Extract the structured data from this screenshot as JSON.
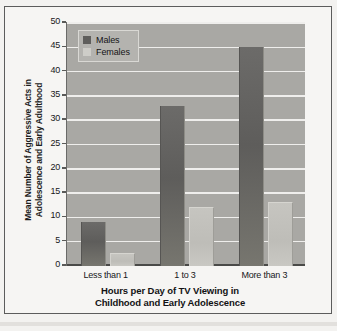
{
  "chart_data": {
    "type": "bar",
    "title": "",
    "xlabel": "Hours per Day of TV Viewing in Childhood and Early Adolescence",
    "xlabel_line1": "Hours per Day of TV Viewing in",
    "xlabel_line2": "Childhood and Early Adolescence",
    "ylabel": "Mean Number of Aggressive Acts in Adolescence and Early Adulthood",
    "ylabel_line1": "Mean Number of Aggressive Acts in",
    "ylabel_line2": "Adolescence and Early Adulthood",
    "categories": [
      "Less than 1",
      "1 to 3",
      "More than 3"
    ],
    "series": [
      {
        "name": "Males",
        "values": [
          9,
          33,
          45
        ],
        "color": "#5f5e5c"
      },
      {
        "name": "Females",
        "values": [
          2.5,
          12,
          13
        ],
        "color": "#cecdc8"
      }
    ],
    "ylim": [
      0,
      50
    ],
    "yticks": [
      0,
      5,
      10,
      15,
      20,
      25,
      30,
      35,
      40,
      45,
      50
    ],
    "ytick_labels": [
      "0",
      "5",
      "10",
      "15",
      "20",
      "25",
      "30",
      "35",
      "40",
      "45",
      "50"
    ],
    "grid": true,
    "legend_position": "upper left",
    "plot_background": "#a9a8a4",
    "figure_background": "#f6f5f3"
  }
}
